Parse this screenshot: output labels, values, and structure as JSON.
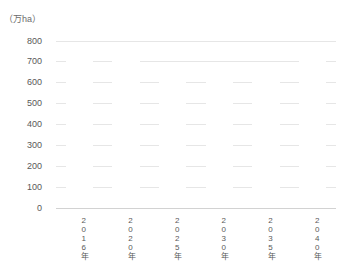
{
  "chart_data": {
    "type": "bar",
    "title": "",
    "subtitle": "",
    "xlabel": "",
    "ylabel": "",
    "unit_label": "（万ha）",
    "categories": [
      "2016年",
      "2020年",
      "2025年",
      "2030年",
      "2035年",
      "2040年"
    ],
    "values": [
      780,
      730,
      700,
      660,
      630,
      780
    ],
    "series": [
      {
        "name": "",
        "values": [
          780,
          730,
          700,
          660,
          630,
          780
        ],
        "color": "#ffffff"
      }
    ],
    "ylim": [
      0,
      800
    ],
    "ytick_values": [
      800,
      700,
      600,
      500,
      400,
      300,
      200,
      100,
      0
    ],
    "ytick_labels": [
      "800",
      "700",
      "600",
      "500",
      "400",
      "300",
      "200",
      "100",
      "0"
    ],
    "grid": true,
    "grid_axis": "y",
    "legend": false,
    "legend_position": "none",
    "annotations": []
  },
  "style": {
    "background": "#ffffff",
    "grid_color": "#e6e6e6",
    "baseline_color": "#d2d2d2",
    "text_color": "#595959",
    "unit_text_color": "#6b6b6b",
    "bar_color": "#ffffff"
  }
}
